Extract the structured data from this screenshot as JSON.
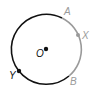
{
  "diagram": {
    "type": "circle-geometry",
    "center": {
      "label": "O",
      "x": 46,
      "y": 49
    },
    "radius": 35,
    "points": [
      {
        "label": "A",
        "role": "arc-endpoint",
        "color": "#999999"
      },
      {
        "label": "X",
        "role": "point-on-arc",
        "color": "#999999"
      },
      {
        "label": "B",
        "role": "arc-endpoint",
        "color": "#999999"
      },
      {
        "label": "Y",
        "role": "point-on-circle",
        "color": "#111111"
      }
    ],
    "arcs": [
      {
        "from": "A",
        "to": "B",
        "via": "X",
        "color": "#999999",
        "description": "minor arc AXB (gray)"
      },
      {
        "from": "B",
        "to": "A",
        "via": "Y",
        "color": "#111111",
        "description": "major arc BYA (black)"
      }
    ]
  },
  "labels": {
    "O": "O",
    "A": "A",
    "X": "X",
    "B": "B",
    "Y": "Y"
  }
}
